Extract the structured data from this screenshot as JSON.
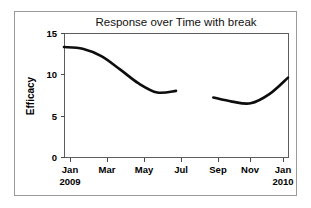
{
  "figure": {
    "background_color": "#ffffff",
    "frame_color": "#9a9a9a",
    "width": 311,
    "height": 208
  },
  "chart_data": {
    "type": "line",
    "title": "Response over Time with break",
    "xlabel": "",
    "ylabel": "Efficacy",
    "ylim": [
      0,
      15
    ],
    "yticks": [
      0,
      5,
      10,
      15
    ],
    "ytick_labels": [
      "0",
      "5",
      "10",
      "15"
    ],
    "xtick_labels": [
      "Jan",
      "Mar",
      "May",
      "Jul",
      "Sep",
      "Nov",
      "Jan"
    ],
    "xtick_sublabels": [
      "2009",
      "",
      "",
      "",
      "",
      "",
      "2010"
    ],
    "grid": false,
    "legend": "none",
    "line_color": "#0d0d0d",
    "has_break": true,
    "break_between": [
      "Jul",
      "Sep"
    ],
    "series": [
      {
        "name": "Efficacy segment 1",
        "x": [
          "Jan 2009",
          "Feb 2009",
          "Mar 2009",
          "Apr 2009",
          "May 2009",
          "Jun 2009",
          "Jul 2009"
        ],
        "values": [
          13.3,
          13.1,
          12.2,
          10.6,
          8.9,
          7.8,
          8.0
        ]
      },
      {
        "name": "Efficacy segment 2",
        "x": [
          "Sep 2009",
          "Oct 2009",
          "Nov 2009",
          "Dec 2009",
          "Jan 2010"
        ],
        "values": [
          7.2,
          6.7,
          6.5,
          7.6,
          9.6
        ]
      }
    ]
  },
  "axes": {
    "y_axis_title": "Efficacy",
    "y_tick_0": "0",
    "y_tick_5": "5",
    "y_tick_10": "10",
    "y_tick_15": "15",
    "x_tick_jan_2009": "Jan",
    "x_tick_year_2009": "2009",
    "x_tick_mar": "Mar",
    "x_tick_may": "May",
    "x_tick_jul": "Jul",
    "x_tick_sep": "Sep",
    "x_tick_nov": "Nov",
    "x_tick_jan_2010": "Jan",
    "x_tick_year_2010": "2010"
  },
  "title": {
    "text": "Response over Time with break"
  }
}
